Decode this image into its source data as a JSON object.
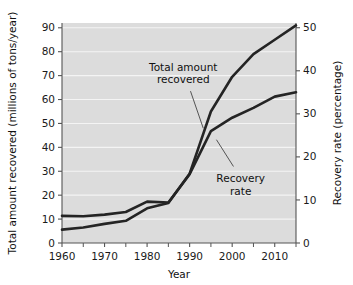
{
  "chart_data": {
    "type": "line",
    "title": "",
    "xlabel": "Year",
    "ylabel": "Total amount recovered (millions of tons/year)",
    "y2label": "Recovery rate (percentage)",
    "xlim": [
      1960,
      2015
    ],
    "ylim": [
      0,
      92
    ],
    "y2lim": [
      0,
      51.1
    ],
    "grid": true,
    "legend_position": "inline-annotations",
    "x_ticks": [
      1960,
      1970,
      1980,
      1990,
      2000,
      2010
    ],
    "x_tick_labels": [
      "1960",
      "1970",
      "1980",
      "1990",
      "2000",
      "2010"
    ],
    "x_minor_ticks": [
      1965,
      1975,
      1985,
      1995,
      2005,
      2015
    ],
    "y_ticks": [
      0,
      10,
      20,
      30,
      40,
      50,
      60,
      70,
      80,
      90
    ],
    "y_tick_labels": [
      "0",
      "10",
      "20",
      "30",
      "40",
      "50",
      "60",
      "70",
      "80",
      "90"
    ],
    "y2_ticks": [
      0,
      10,
      20,
      30,
      40,
      50
    ],
    "y2_tick_labels": [
      "0",
      "10",
      "20",
      "30",
      "40",
      "50"
    ],
    "series": [
      {
        "name": "Total amount recovered",
        "axis": "left",
        "units": "millions of tons/year",
        "x": [
          1960,
          1965,
          1970,
          1975,
          1980,
          1985,
          1990,
          1995,
          2000,
          2005,
          2010,
          2015
        ],
        "values": [
          5.6,
          6.5,
          8.0,
          9.3,
          14.5,
          16.7,
          29.0,
          55.0,
          69.5,
          79.0,
          85.0,
          91.0
        ]
      },
      {
        "name": "Recovery rate",
        "axis": "right",
        "units": "percentage",
        "x": [
          1960,
          1965,
          1970,
          1975,
          1980,
          1985,
          1990,
          1995,
          2000,
          2005,
          2010,
          2015
        ],
        "values": [
          6.3,
          6.2,
          6.6,
          7.2,
          9.6,
          9.4,
          16.0,
          26.0,
          29.1,
          31.4,
          34.0,
          35.0
        ]
      }
    ],
    "annotations": [
      {
        "name": "total-amount-recovered",
        "lines": [
          "Total amount",
          "recovered"
        ],
        "text_x": 1988.5,
        "text_y": 72,
        "leader_from": [
          1990.2,
          63.5
        ],
        "leader_to": [
          1993.2,
          48.0
        ]
      },
      {
        "name": "recovery-rate",
        "lines": [
          "Recovery",
          "rate"
        ],
        "text_x": 2002.0,
        "text_y": 25.5,
        "leader_from": [
          2000.3,
          32.0
        ],
        "leader_to": [
          1996.3,
          43.2
        ]
      }
    ],
    "colors": {
      "plot_background": "#dcdcdc",
      "gridline": "#f4f4f4",
      "line": "#242424",
      "axis": "#555555",
      "text": "#111111",
      "page_background": "#ffffff"
    }
  }
}
